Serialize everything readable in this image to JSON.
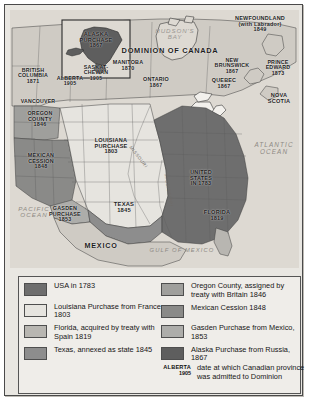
{
  "map": {
    "title": "Territorial expansion of the United States and Dominion of Canada",
    "ocean_labels": [
      {
        "name": "pacific-ocean",
        "text": "PACIFIC\nOCEAN"
      },
      {
        "name": "atlantic-ocean",
        "text": "ATLANTIC\nOCEAN"
      },
      {
        "name": "gulf-of-mexico",
        "text": "GULF OF MEXICO"
      },
      {
        "name": "hudsons-bay",
        "text": "HUDSON'S\nBAY"
      }
    ],
    "country_labels": [
      {
        "name": "dominion-of-canada",
        "text": "DOMINION OF CANADA"
      },
      {
        "name": "mexico",
        "text": "MEXICO"
      }
    ],
    "river_labels": [
      {
        "name": "missouri-river",
        "text": "MISSOURI"
      },
      {
        "name": "mississippi-river",
        "text": "MISSISSIPPI"
      }
    ],
    "inset": {
      "name": "alaska-inset",
      "label": "ALASKA\nPURCHASE\n1867"
    },
    "territory_labels": [
      {
        "name": "british-columbia",
        "text": "BRITISH\nCOLUMBIA\n1871"
      },
      {
        "name": "alberta",
        "text": "ALBERTA\n1905"
      },
      {
        "name": "saskatchewan",
        "text": "SASKAT-\nCHEWAN\n1905"
      },
      {
        "name": "manitoba",
        "text": "MANITOBA\n1870"
      },
      {
        "name": "ontario",
        "text": "ONTARIO\n1867"
      },
      {
        "name": "quebec",
        "text": "QUEBEC\n1867"
      },
      {
        "name": "new-brunswick",
        "text": "NEW\nBRUNSWICK\n1867"
      },
      {
        "name": "prince-edward",
        "text": "PRINCE\nEDWARD\n1873"
      },
      {
        "name": "nova-scotia",
        "text": "NOVA\nSCOTIA"
      },
      {
        "name": "newfoundland",
        "text": "NEWFOUNDLAND\n(with Labrador)\n1849"
      },
      {
        "name": "vancouver",
        "text": "VANCOUVER"
      },
      {
        "name": "oregon-county",
        "text": "OREGON\nCOUNTY\n1846"
      },
      {
        "name": "mexican-cession",
        "text": "MEXICAN\nCESSION\n1848"
      },
      {
        "name": "gasden-purchase",
        "text": "GASDEN\nPURCHASE\n1853"
      },
      {
        "name": "louisiana-purchase",
        "text": "LOUISIANA\nPURCHASE\n1803"
      },
      {
        "name": "texas",
        "text": "TEXAS\n1845"
      },
      {
        "name": "united-states-1783",
        "text": "UNITED\nSTATES\nIN 1783"
      },
      {
        "name": "florida",
        "text": "FLORIDA\n1819"
      }
    ]
  },
  "legend": {
    "left": [
      {
        "name": "legend-usa-1783",
        "swatch": "#6e6e6e",
        "text": "USA in 1783"
      },
      {
        "name": "legend-louisiana",
        "swatch": "#e6e4df",
        "text": "Louisiana Purchase from France 1803"
      },
      {
        "name": "legend-florida",
        "swatch": "#b8b6b1",
        "text": "Florida, acquired by treaty with Spain 1819"
      },
      {
        "name": "legend-texas",
        "swatch": "#8d8d8d",
        "text": "Texas, annexed as state 1845"
      }
    ],
    "right": [
      {
        "name": "legend-oregon-county",
        "swatch": "#9f9f9c",
        "text": "Oregon County, assigned by treaty with Britain 1846"
      },
      {
        "name": "legend-mexican-cession",
        "swatch": "#8a8a88",
        "text": "Mexican Cession 1848"
      },
      {
        "name": "legend-gasden",
        "swatch": "#adadaa",
        "text": "Gasden Purchase from Mexico, 1853"
      },
      {
        "name": "legend-alaska",
        "swatch": "#5e5e5e",
        "text": "Alaska Purchase from Russia, 1867"
      }
    ],
    "note": {
      "name": "legend-province-date-note",
      "key_line1": "ALBERTA",
      "key_line2": "1905",
      "text": "date at which Canadian province was admitted to Dominion"
    }
  },
  "colors": {
    "usa_1783": "#6e6e6e",
    "louisiana": "#e6e4df",
    "florida": "#b8b6b1",
    "texas": "#8d8d8d",
    "oregon": "#9f9f9c",
    "mexican_cession": "#8a8a88",
    "gasden": "#adadaa",
    "alaska": "#5e5e5e",
    "canada": "#cfcbc4",
    "mexico": "#cfcbc4",
    "water": "#ddd9d2",
    "frame": "#4a4a4a"
  }
}
